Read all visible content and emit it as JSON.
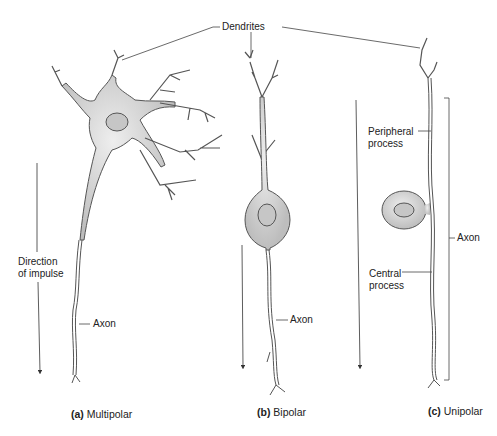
{
  "diagram": {
    "title_label": "Dendrites",
    "panels": [
      {
        "letter": "(a)",
        "name": "Multipolar",
        "labels": {
          "axon": "Axon",
          "direction_line1": "Direction",
          "direction_line2": "of impulse"
        }
      },
      {
        "letter": "(b)",
        "name": "Bipolar",
        "labels": {
          "axon": "Axon"
        }
      },
      {
        "letter": "(c)",
        "name": "Unipolar",
        "labels": {
          "axon": "Axon",
          "peripheral_line1": "Peripheral",
          "peripheral_line2": "process",
          "central_line1": "Central",
          "central_line2": "process"
        }
      }
    ],
    "colors": {
      "cell_fill": "#d6d6d6",
      "nucleus_fill": "#c4c4c4",
      "outline": "#555555",
      "line": "#333333"
    }
  }
}
